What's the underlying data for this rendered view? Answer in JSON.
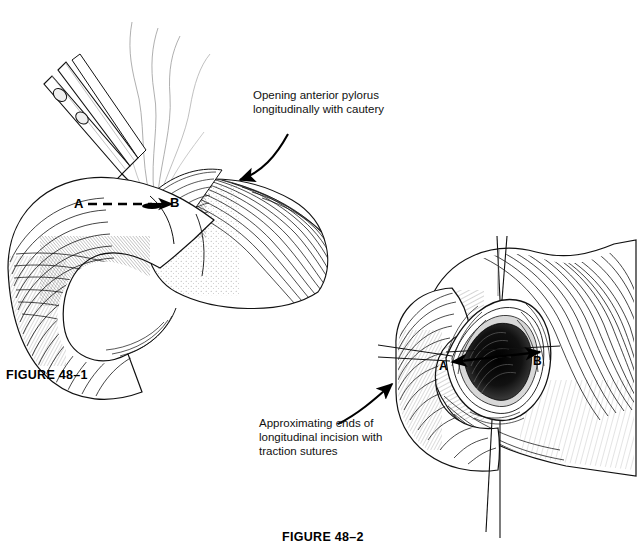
{
  "page": {
    "background": "#ffffff",
    "ink": "#000000",
    "width": 640,
    "height": 560
  },
  "figures": [
    {
      "id": "figure-48-1",
      "caption": "FIGURE 48–1",
      "caption_pos": {
        "x": 6,
        "y": 368
      },
      "annotation": {
        "name": "cautery-annotation",
        "lines": [
          "Opening anterior pylorus",
          "longitudinally with cautery"
        ],
        "pos": {
          "x": 253,
          "y": 90
        }
      },
      "markers": [
        {
          "label": "A",
          "x": 76,
          "y": 200
        },
        {
          "label": "B",
          "x": 168,
          "y": 199
        }
      ],
      "incision": {
        "style": "dashed",
        "from_marker": "A",
        "to_marker": "B",
        "arrowhead": "B"
      },
      "parts": [
        "cautery-instrument",
        "smoke-wisps",
        "stomach-antrum",
        "duodenal-loop",
        "pylorus"
      ]
    },
    {
      "id": "figure-48-2",
      "caption": "FIGURE 48–2",
      "caption_pos": {
        "x": 282,
        "y": 530
      },
      "annotation": {
        "name": "traction-suture-annotation",
        "lines": [
          "Approximating ends of",
          "longitudinal incision with",
          "traction sutures"
        ],
        "pos": {
          "x": 259,
          "y": 418
        }
      },
      "markers": [
        {
          "label": "A",
          "x": 443,
          "y": 360
        },
        {
          "label": "B",
          "x": 535,
          "y": 357
        }
      ],
      "incision": {
        "style": "solid",
        "from_marker": "A",
        "to_marker": "B",
        "arrowhead": "both"
      },
      "parts": [
        "opened-pylorus-lumen",
        "traction-sutures-vertical",
        "traction-sutures-horizontal",
        "stomach-body",
        "duodenum"
      ]
    }
  ]
}
